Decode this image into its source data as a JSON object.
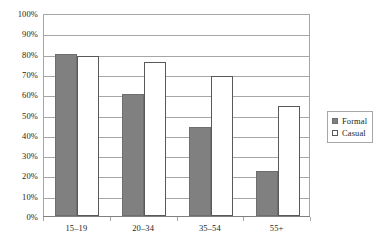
{
  "chart_data": {
    "type": "bar",
    "title": "",
    "subtitle": "",
    "xlabel": "",
    "ylabel": "",
    "categories": [
      "15–19",
      "20–34",
      "35–54",
      "55+"
    ],
    "series": [
      {
        "name": "Formal",
        "color": "#808080",
        "values": [
          80,
          60,
          44,
          22
        ]
      },
      {
        "name": "Casual",
        "color": "#ffffff",
        "values": [
          79,
          76,
          69,
          54
        ]
      }
    ],
    "ylim": [
      0,
      100
    ],
    "y_ticks": [
      0,
      10,
      20,
      30,
      40,
      50,
      60,
      70,
      80,
      90,
      100
    ],
    "y_tick_labels": [
      "0%",
      "10%",
      "20%",
      "30%",
      "40%",
      "50%",
      "60%",
      "70%",
      "80%",
      "90%",
      "100%"
    ],
    "value_suffix": "%",
    "grid": true,
    "grid_axis": "y",
    "legend": {
      "position": "right",
      "entries": [
        {
          "label": "Formal",
          "swatch": "filled-gray-square"
        },
        {
          "label": "Casual",
          "swatch": "outlined-white-square"
        }
      ]
    },
    "colors": {
      "formal_fill": "#808080",
      "casual_fill": "#ffffff",
      "bar_outline": "#595959",
      "gridline": "#a6a6a6",
      "axis": "#808080",
      "text": "#231f20",
      "background": "#ffffff"
    }
  }
}
